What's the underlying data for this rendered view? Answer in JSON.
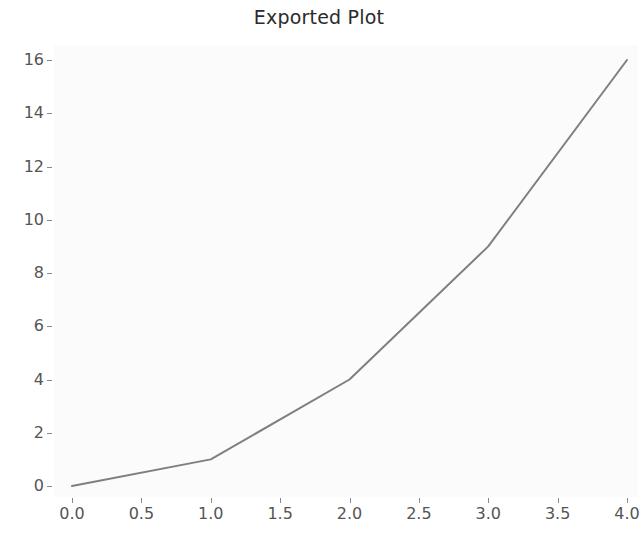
{
  "figure": {
    "title": "Exported Plot",
    "background_color": "#ffffff",
    "axes_background_color": "#fbfbfb",
    "line_color": "#7f7f7f",
    "tick_color": "#8a8a8a",
    "tick_label_color": "#555555",
    "title_color": "#2b2b2b"
  },
  "chart_data": {
    "type": "line",
    "title": "Exported Plot",
    "xlabel": "",
    "ylabel": "",
    "x": [
      0,
      1,
      2,
      3,
      4
    ],
    "y": [
      0,
      1,
      4,
      9,
      16
    ],
    "series": [
      {
        "name": "",
        "x": [
          0,
          1,
          2,
          3,
          4
        ],
        "values": [
          0,
          1,
          4,
          9,
          16
        ],
        "color": "#7f7f7f",
        "line_width": 2,
        "marker": "none"
      }
    ],
    "xlim": [
      0.0,
      4.0
    ],
    "ylim": [
      0.0,
      16.0
    ],
    "xticks": [
      0.0,
      0.5,
      1.0,
      1.5,
      2.0,
      2.5,
      3.0,
      3.5,
      4.0
    ],
    "yticks": [
      0,
      2,
      4,
      6,
      8,
      10,
      12,
      14,
      16
    ],
    "xtick_labels": [
      "0.0",
      "0.5",
      "1.0",
      "1.5",
      "2.0",
      "2.5",
      "3.0",
      "3.5",
      "4.0"
    ],
    "ytick_labels": [
      "0",
      "2",
      "4",
      "6",
      "8",
      "10",
      "12",
      "14",
      "16"
    ],
    "grid": false,
    "legend": null,
    "annotations": []
  }
}
